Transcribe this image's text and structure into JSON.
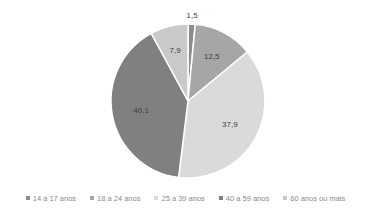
{
  "chart_data": {
    "type": "pie",
    "title": "",
    "categories": [
      "14 a 17 anos",
      "18 a 24 anos",
      "25 a 39 anos",
      "40 a 59 anos",
      "60 anos ou mais"
    ],
    "values": [
      1.5,
      12.5,
      37.9,
      40.1,
      7.9
    ],
    "labels": [
      "1,5",
      "12,5",
      "37,9",
      "40,1",
      "7,9"
    ],
    "colors": [
      "#8c8c8c",
      "#a6a6a6",
      "#dadada",
      "#808080",
      "#c9c9c9"
    ],
    "start_angle": "12 o'clock",
    "direction": "clockwise",
    "legend_position": "bottom"
  }
}
